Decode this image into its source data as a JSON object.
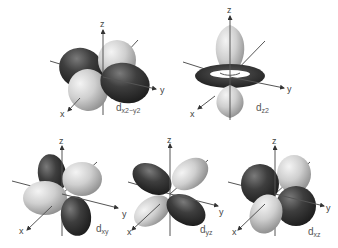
{
  "figure": {
    "colors": {
      "dark_lobe": "#3a3a3a",
      "light_lobe": "#c8c8c8",
      "axis": "#555555",
      "background": "#ffffff"
    },
    "orbitals": [
      {
        "id": "dx2-y2",
        "label_main": "d",
        "label_sub": "x2−y2",
        "axes": {
          "x": "x",
          "y": "y",
          "z": "z"
        }
      },
      {
        "id": "dz2",
        "label_main": "d",
        "label_sub": "z2",
        "axes": {
          "x": "x",
          "y": "y",
          "z": "z"
        }
      },
      {
        "id": "dxy",
        "label_main": "d",
        "label_sub": "xy",
        "axes": {
          "x": "x",
          "y": "y",
          "z": "z"
        }
      },
      {
        "id": "dyz",
        "label_main": "d",
        "label_sub": "yz",
        "axes": {
          "x": "x",
          "y": "y",
          "z": "z"
        }
      },
      {
        "id": "dxz",
        "label_main": "d",
        "label_sub": "xz",
        "axes": {
          "x": "x",
          "y": "y",
          "z": "z"
        }
      }
    ]
  }
}
